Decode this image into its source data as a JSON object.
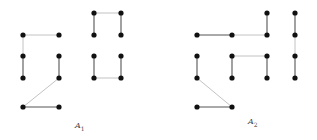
{
  "colors": {
    "node": "#111111",
    "edge_dark": "#555555",
    "edge_light": "#bbbbbb",
    "label": "#444444"
  },
  "diagrams": [
    {
      "id": "A1",
      "label": "A",
      "subscript": "1",
      "label_pos": [
        75,
        121
      ],
      "nodes": [
        [
          23,
          35
        ],
        [
          59,
          35
        ],
        [
          23,
          56
        ],
        [
          59,
          56
        ],
        [
          23,
          78
        ],
        [
          59,
          78
        ],
        [
          23,
          107
        ],
        [
          59,
          107
        ],
        [
          94,
          13
        ],
        [
          121,
          13
        ],
        [
          94,
          35
        ],
        [
          121,
          35
        ],
        [
          94,
          56
        ],
        [
          121,
          56
        ],
        [
          94,
          78
        ],
        [
          121,
          78
        ]
      ],
      "edges": [
        [
          [
            23,
            35
          ],
          [
            59,
            35
          ],
          "light"
        ],
        [
          [
            23,
            35
          ],
          [
            23,
            56
          ],
          "light"
        ],
        [
          [
            23,
            56
          ],
          [
            23,
            78
          ],
          "dark"
        ],
        [
          [
            59,
            56
          ],
          [
            59,
            78
          ],
          "dark"
        ],
        [
          [
            59,
            78
          ],
          [
            23,
            107
          ],
          "light"
        ],
        [
          [
            23,
            107
          ],
          [
            59,
            107
          ],
          "dark"
        ],
        [
          [
            94,
            13
          ],
          [
            121,
            13
          ],
          "light"
        ],
        [
          [
            94,
            13
          ],
          [
            94,
            35
          ],
          "dark"
        ],
        [
          [
            121,
            13
          ],
          [
            121,
            35
          ],
          "dark"
        ],
        [
          [
            94,
            56
          ],
          [
            94,
            78
          ],
          "dark"
        ],
        [
          [
            121,
            56
          ],
          [
            121,
            78
          ],
          "dark"
        ],
        [
          [
            94,
            78
          ],
          [
            121,
            78
          ],
          "light"
        ]
      ]
    },
    {
      "id": "A2",
      "label": "A",
      "subscript": "2",
      "label_pos": [
        248,
        117
      ],
      "nodes": [
        [
          197,
          35
        ],
        [
          232,
          35
        ],
        [
          267,
          13
        ],
        [
          267,
          35
        ],
        [
          295,
          13
        ],
        [
          295,
          35
        ],
        [
          197,
          56
        ],
        [
          232,
          56
        ],
        [
          267,
          56
        ],
        [
          295,
          56
        ],
        [
          197,
          78
        ],
        [
          232,
          78
        ],
        [
          267,
          78
        ],
        [
          295,
          78
        ],
        [
          197,
          107
        ],
        [
          232,
          107
        ]
      ],
      "edges": [
        [
          [
            197,
            35
          ],
          [
            232,
            35
          ],
          "dark"
        ],
        [
          [
            232,
            35
          ],
          [
            267,
            35
          ],
          "light"
        ],
        [
          [
            267,
            13
          ],
          [
            267,
            35
          ],
          "dark"
        ],
        [
          [
            295,
            13
          ],
          [
            295,
            35
          ],
          "dark"
        ],
        [
          [
            295,
            35
          ],
          [
            295,
            56
          ],
          "light"
        ],
        [
          [
            295,
            56
          ],
          [
            295,
            78
          ],
          "dark"
        ],
        [
          [
            197,
            56
          ],
          [
            197,
            78
          ],
          "dark"
        ],
        [
          [
            232,
            56
          ],
          [
            232,
            78
          ],
          "dark"
        ],
        [
          [
            232,
            56
          ],
          [
            267,
            56
          ],
          "light"
        ],
        [
          [
            267,
            56
          ],
          [
            267,
            78
          ],
          "dark"
        ],
        [
          [
            197,
            78
          ],
          [
            232,
            107
          ],
          "light"
        ],
        [
          [
            197,
            107
          ],
          [
            232,
            107
          ],
          "dark"
        ]
      ]
    }
  ]
}
